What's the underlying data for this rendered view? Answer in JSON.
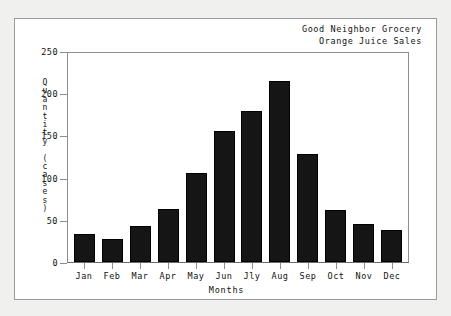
{
  "card": {
    "title_line1": "Good Neighbor Grocery",
    "title_line2": "Orange Juice Sales"
  },
  "chart_data": {
    "type": "bar",
    "title": "Good Neighbor Grocery Orange Juice Sales",
    "subtitle": "Orange Juice Sales",
    "xlabel": "Months",
    "ylabel": "Quantity (cases)",
    "categories": [
      "Jan",
      "Feb",
      "Mar",
      "Apr",
      "May",
      "Jun",
      "Jly",
      "Aug",
      "Sep",
      "Oct",
      "Nov",
      "Dec"
    ],
    "values": [
      33,
      27,
      43,
      63,
      107,
      157,
      181,
      217,
      129,
      62,
      45,
      38
    ],
    "ylim": [
      0,
      250
    ],
    "yticks": [
      0,
      50,
      100,
      150,
      200,
      250
    ],
    "ytick_labels": [
      "0",
      "50",
      "100",
      "150",
      "200",
      "250"
    ],
    "grid": false,
    "legend": false,
    "bar_color": "#151515",
    "frame_color": "#8e8e8e",
    "background": "#ffffff"
  },
  "axis": {
    "y_title_chars": [
      "Q",
      "u",
      "a",
      "n",
      "t",
      "i",
      "t",
      "y",
      " ",
      "(",
      "c",
      "a",
      "s",
      "e",
      "s",
      ")"
    ]
  }
}
